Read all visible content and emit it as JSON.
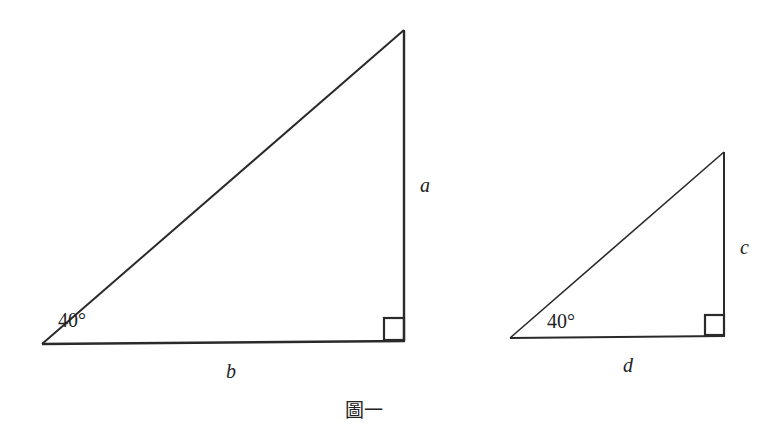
{
  "figure": {
    "caption": "圖一",
    "triangles": [
      {
        "id": "large",
        "angle_label": "40°",
        "vertical_side_label": "a",
        "horizontal_side_label": "b",
        "right_angle": true
      },
      {
        "id": "small",
        "angle_label": "40°",
        "vertical_side_label": "c",
        "horizontal_side_label": "d",
        "right_angle": true
      }
    ]
  }
}
